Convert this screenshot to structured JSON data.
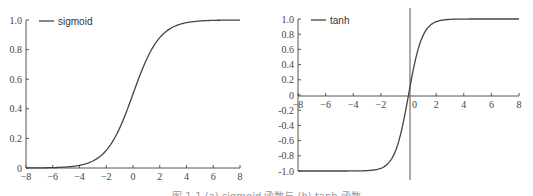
{
  "caption": "图 1-1 (a) sigmoid 函数与 (b) tanh 函数",
  "chart_data": [
    {
      "type": "line",
      "title": "",
      "legend": [
        "sigmoid"
      ],
      "legend_position": "upper-left",
      "x": [
        -8,
        -7,
        -6,
        -5,
        -4,
        -3,
        -2,
        -1,
        0,
        1,
        2,
        3,
        4,
        5,
        6,
        7,
        8
      ],
      "series": [
        {
          "name": "sigmoid",
          "values": [
            0.0003,
            0.0009,
            0.0025,
            0.0067,
            0.018,
            0.047,
            0.119,
            0.269,
            0.5,
            0.731,
            0.881,
            0.953,
            0.982,
            0.993,
            0.998,
            0.999,
            1.0
          ]
        }
      ],
      "xlim": [
        -8,
        8
      ],
      "ylim": [
        0,
        1.0
      ],
      "xticks": [
        "-8",
        "-6",
        "-4",
        "-2",
        "0",
        "2",
        "4",
        "6",
        "8"
      ],
      "yticks": [
        "0",
        "0.2",
        "0.4",
        "0.6",
        "0.8",
        "1.0"
      ],
      "grid": false
    },
    {
      "type": "line",
      "title": "",
      "legend": [
        "tanh"
      ],
      "legend_position": "upper-left",
      "x": [
        -8,
        -7,
        -6,
        -5,
        -4,
        -3,
        -2,
        -1,
        0,
        1,
        2,
        3,
        4,
        5,
        6,
        7,
        8
      ],
      "series": [
        {
          "name": "tanh",
          "values": [
            -1.0,
            -1.0,
            -1.0,
            -1.0,
            -0.999,
            -0.995,
            -0.964,
            -0.762,
            0,
            0.762,
            0.964,
            0.995,
            0.999,
            1.0,
            1.0,
            1.0,
            1.0
          ]
        }
      ],
      "xlim": [
        -8,
        8
      ],
      "ylim": [
        -1.0,
        1.0
      ],
      "xticks": [
        "-8",
        "-6",
        "-4",
        "-2",
        "0",
        "2",
        "4",
        "6",
        "8"
      ],
      "yticks": [
        "-1.0",
        "-0.8",
        "-0.6",
        "-0.4",
        "-0.2",
        "0",
        "0.2",
        "0.4",
        "0.6",
        "0.8",
        "1.0"
      ],
      "grid": false
    }
  ]
}
